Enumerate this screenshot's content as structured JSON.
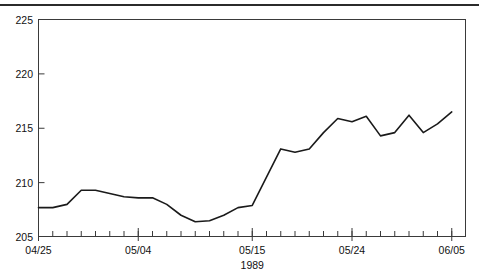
{
  "figure": {
    "has_top_rule": true,
    "background": "#ffffff",
    "line_color": "#1a1a1a",
    "axis_color": "#3a3a3a"
  },
  "chart_data": {
    "type": "line",
    "title": "",
    "subtitle": "",
    "xlabel": "1989",
    "ylabel": "",
    "ylim": [
      205,
      225
    ],
    "xlim": [
      0,
      30
    ],
    "grid": false,
    "legend": false,
    "y_ticks": [
      205,
      210,
      215,
      220,
      225
    ],
    "y_tick_labels": [
      "205",
      "210",
      "215",
      "220",
      "225"
    ],
    "x_tick_labels": [
      "04/25",
      "05/04",
      "05/15",
      "05/24",
      "06/05"
    ],
    "x_tick_label_positions": [
      0,
      7,
      15,
      22,
      29
    ],
    "x_minor_tick_count": 30,
    "x": [
      0,
      1,
      2,
      3,
      4,
      5,
      6,
      7,
      8,
      9,
      10,
      11,
      12,
      13,
      14,
      15,
      16,
      17,
      18,
      19,
      20,
      21,
      22,
      23,
      24,
      25,
      26,
      27,
      28,
      29
    ],
    "series": [
      {
        "name": "value",
        "values": [
          207.7,
          207.7,
          208.0,
          209.3,
          209.3,
          209.0,
          208.7,
          208.6,
          208.6,
          208.0,
          207.0,
          206.4,
          206.5,
          207.0,
          207.7,
          207.9,
          210.5,
          213.1,
          212.8,
          213.1,
          214.6,
          215.9,
          215.6,
          216.1,
          214.3,
          214.6,
          216.2,
          214.6,
          215.4,
          216.5
        ]
      }
    ],
    "annotations": []
  },
  "axis": {
    "x_label_text": "1989"
  }
}
